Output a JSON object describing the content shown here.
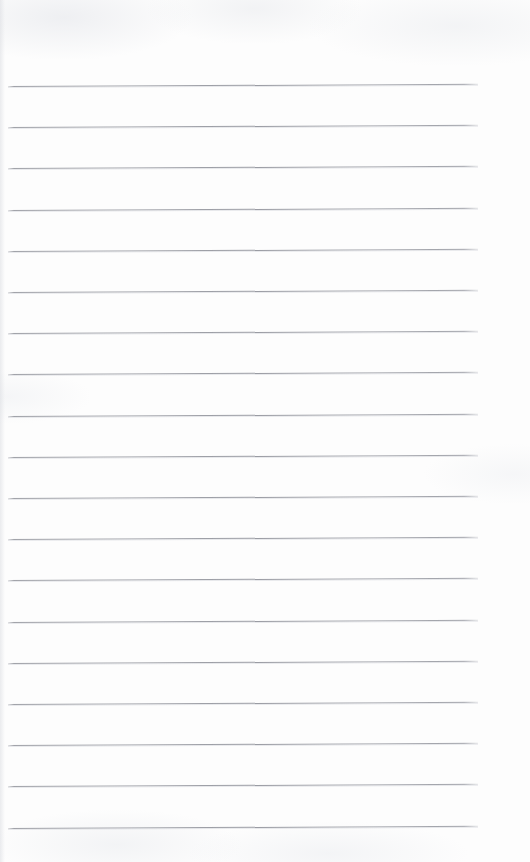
{
  "document": {
    "kind": "scanned-lined-paper",
    "title": "Blank lined notebook page",
    "page_width": 530,
    "page_height": 862,
    "background_color": "#fdfdfd",
    "written_content": "",
    "has_handwriting": false,
    "has_printed_text": false
  },
  "ruling": {
    "line_color": "#9a9ca3",
    "line_thickness_px": 1,
    "line_count": 19,
    "line_start_x": 8,
    "line_end_x": 478,
    "line_length_px": 470,
    "first_line_y": 86,
    "last_line_y": 827,
    "line_spacing_px": 41.2,
    "skew_degrees": -0.26,
    "top_margin_px": 86,
    "bottom_margin_px": 35,
    "left_margin_px": 8,
    "right_margin_px": 52,
    "lines_y": [
      86,
      127.2,
      168.4,
      209.6,
      250.8,
      292.0,
      333.2,
      374.4,
      415.6,
      456.8,
      498.0,
      539.2,
      580.4,
      621.6,
      662.8,
      704.0,
      745.2,
      786.4,
      827.6
    ]
  }
}
